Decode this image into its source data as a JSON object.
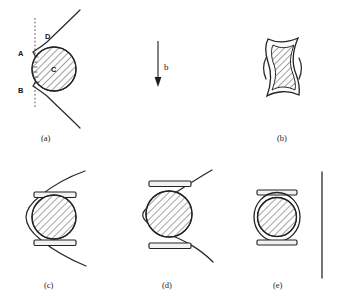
{
  "figure": {
    "background_color": "#ffffff",
    "ink_color": "#222222",
    "width": 338,
    "height": 299
  },
  "vector_annotation": {
    "label": "b",
    "direction": "down",
    "description": "downward-pointing field vector arrow"
  },
  "panels": [
    {
      "id": "a",
      "caption": "(a)",
      "markers": [
        {
          "label": "A",
          "role": "upper-cusp-point"
        },
        {
          "label": "B",
          "role": "lower-cusp-point"
        },
        {
          "label": "C",
          "role": "sphere-interior"
        },
        {
          "label": "D",
          "role": "upper-field-line"
        }
      ],
      "elements": [
        "dashed-vertical-axis",
        "cusped-field-line",
        "hatched-circle",
        "compression-ticks"
      ]
    },
    {
      "id": "b",
      "caption": "(b)",
      "markers": [],
      "elements": [
        "concave-hourglass-outline",
        "hatched-inner-region"
      ]
    },
    {
      "id": "c",
      "caption": "(c)",
      "markers": [],
      "elements": [
        "open-c-field-line",
        "hatched-circle",
        "upper-plate",
        "lower-plate"
      ]
    },
    {
      "id": "d",
      "caption": "(d)",
      "markers": [],
      "elements": [
        "s-shaped-field-line",
        "hatched-circle",
        "upper-plate",
        "lower-plate"
      ]
    },
    {
      "id": "e",
      "caption": "(e)",
      "markers": [],
      "elements": [
        "closed-ring",
        "hatched-circle",
        "upper-plate",
        "lower-plate",
        "straight-vertical-line"
      ]
    }
  ]
}
